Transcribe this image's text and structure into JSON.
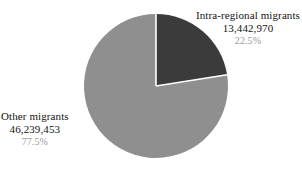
{
  "chart_data": {
    "type": "pie",
    "title": "",
    "subtitle": "",
    "xlabel": "",
    "ylabel": "",
    "grid": false,
    "legend_position": "none",
    "background_color": "#ffffff",
    "start_angle_deg": 0,
    "direction": "clockwise",
    "center": {
      "x": 156,
      "y": 86
    },
    "radius": 72,
    "separator_color": "#ffffff",
    "total": 59682423,
    "categories": [
      "Intra-regional migrants",
      "Other migrants"
    ],
    "values": [
      13442970,
      46239453
    ],
    "percentages": [
      22.5,
      77.5
    ],
    "colors": [
      "#3b3b3b",
      "#8f8f8f"
    ],
    "slices": [
      {
        "label": "Intra-regional migrants",
        "value": 13442970,
        "value_text": "13,442,970",
        "percent": 22.5,
        "percent_text": "22.5%",
        "color": "#3b3b3b",
        "start_angle_deg": 0,
        "end_angle_deg": 81
      },
      {
        "label": "Other migrants",
        "value": 46239453,
        "value_text": "46,239,453",
        "percent": 77.5,
        "percent_text": "77.5%",
        "color": "#8f8f8f",
        "start_angle_deg": 81,
        "end_angle_deg": 360
      }
    ],
    "annotations": [
      {
        "name": "intra-regional-migrants",
        "title": "Intra-regional migrants",
        "value_text": "13,442,970",
        "percent_text": "22.5%",
        "position": "top-right"
      },
      {
        "name": "other-migrants",
        "title": "Other migrants",
        "value_text": "46,239,453",
        "percent_text": "77.5%",
        "position": "bottom-left"
      }
    ]
  }
}
